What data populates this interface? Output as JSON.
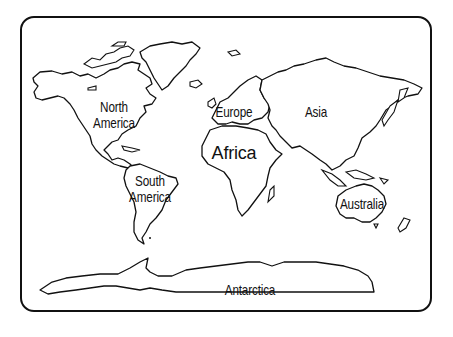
{
  "map": {
    "title": "World Map - Continents",
    "frame_color": "#111111",
    "background": "#ffffff",
    "labels": {
      "north_america_line1": "North",
      "north_america_line2": "America",
      "south_america_line1": "South",
      "south_america_line2": "America",
      "europe": "Europe",
      "africa": "Africa",
      "asia": "Asia",
      "australia": "Australia",
      "antarctica": "Antarctica"
    }
  }
}
